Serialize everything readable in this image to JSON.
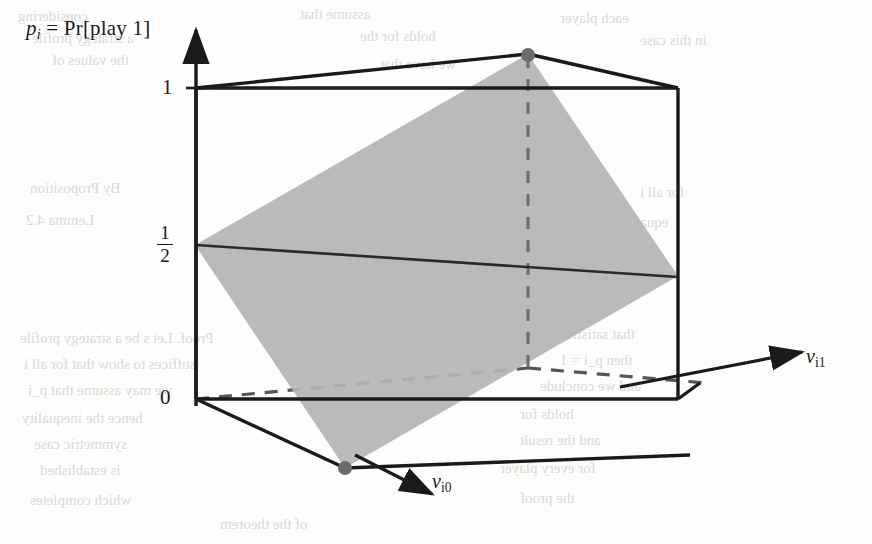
{
  "figure": {
    "domain": "chart",
    "caption_y_axis": "p_i = Pr[play 1]",
    "axis_caption_parts": {
      "p": "p",
      "i": "i",
      "eq": " = ",
      "pr": "Pr[play 1]"
    },
    "y_ticks": [
      {
        "label": "1",
        "value": 1
      },
      {
        "label": "1/2",
        "numerator": "1",
        "denominator": "2",
        "value": 0.5
      },
      {
        "label": "0",
        "value": 0
      }
    ],
    "x_axis_label": "v",
    "x_axis_sub": "i1",
    "z_axis_label": "v",
    "z_axis_sub": "i0",
    "colors": {
      "line": "#1a1a1a",
      "plane_fill": "#b3b3b3",
      "dashed": "#6e6e6e",
      "marker": "#6b6b6b",
      "background": "#fdfdfc",
      "bleed_text": "#cfcdc8"
    }
  },
  "chart_data": {
    "type": "diagram-3d",
    "title": "",
    "axes": {
      "vertical": {
        "name": "p_i = Pr[play 1]",
        "ticks": [
          "0",
          "1/2",
          "1"
        ],
        "range": [
          0,
          1
        ]
      },
      "horizontal_right": {
        "name": "v_i1",
        "range": [
          0,
          1
        ]
      },
      "depth_front": {
        "name": "v_i0",
        "range": [
          0,
          1
        ]
      }
    },
    "cube_vertices_px": {
      "front_bottom_left": [
        195,
        398
      ],
      "front_top_left": [
        195,
        88
      ],
      "front_bottom_right": [
        678,
        398
      ],
      "front_top_right": [
        678,
        88
      ],
      "back_bottom_left": [
        345,
        468
      ],
      "back_top_left": [
        345,
        158
      ],
      "back_bottom_right": [
        828,
        468
      ],
      "back_top_right": [
        828,
        158
      ]
    },
    "plane_vertices_px": [
      [
        528,
        54
      ],
      [
        678,
        276
      ],
      [
        345,
        468
      ],
      [
        195,
        245
      ]
    ],
    "markers_px": [
      {
        "name": "top-back-vertex",
        "x": 528,
        "y": 54
      },
      {
        "name": "bottom-front-vertex",
        "x": 345,
        "y": 468
      }
    ],
    "dashed_segments": [
      {
        "name": "vertical-back-edge",
        "from": [
          528,
          54
        ],
        "to": [
          528,
          368
        ]
      },
      {
        "name": "bottom-back-edge-left",
        "from": [
          195,
          398
        ],
        "to": [
          528,
          368
        ]
      },
      {
        "name": "bottom-back-edge-right",
        "from": [
          528,
          368
        ],
        "to": [
          700,
          382
        ]
      }
    ],
    "half_level_line": {
      "from": [
        195,
        245
      ],
      "to": [
        678,
        276
      ]
    },
    "legend": [],
    "grid": false
  },
  "bleed_lines": [
    {
      "text": "considering",
      "x": 18,
      "y": 8
    },
    {
      "text": "assume that",
      "x": 300,
      "y": 6
    },
    {
      "text": "each player",
      "x": 560,
      "y": 10
    },
    {
      "text": "a strategy profile",
      "x": 32,
      "y": 30
    },
    {
      "text": "holds for the",
      "x": 360,
      "y": 28
    },
    {
      "text": "in this case",
      "x": 640,
      "y": 32
    },
    {
      "text": "the values of",
      "x": 52,
      "y": 52
    },
    {
      "text": "we have that",
      "x": 380,
      "y": 56
    },
    {
      "text": "By Proposition",
      "x": 30,
      "y": 180
    },
    {
      "text": "we obtain that",
      "x": 330,
      "y": 176
    },
    {
      "text": "for all i",
      "x": 640,
      "y": 184
    },
    {
      "text": "Lemma 4.2",
      "x": 26,
      "y": 212
    },
    {
      "text": "it follows that",
      "x": 300,
      "y": 206
    },
    {
      "text": "equality",
      "x": 620,
      "y": 214
    },
    {
      "text": "Proof. Let s be a strategy profile",
      "x": 20,
      "y": 330
    },
    {
      "text": "that satisfies",
      "x": 560,
      "y": 326
    },
    {
      "text": "suffices to show that for all i",
      "x": 24,
      "y": 356
    },
    {
      "text": "then p_i = 1",
      "x": 560,
      "y": 352
    },
    {
      "text": "we may assume that p_i",
      "x": 28,
      "y": 382
    },
    {
      "text": "and we conclude",
      "x": 540,
      "y": 378
    },
    {
      "text": "hence the inequality",
      "x": 22,
      "y": 410
    },
    {
      "text": "holds for",
      "x": 520,
      "y": 406
    },
    {
      "text": "symmetric case",
      "x": 34,
      "y": 436
    },
    {
      "text": "and the result",
      "x": 520,
      "y": 432
    },
    {
      "text": "is established",
      "x": 40,
      "y": 462
    },
    {
      "text": "for every player",
      "x": 500,
      "y": 460
    },
    {
      "text": "which completes",
      "x": 30,
      "y": 492
    },
    {
      "text": "the proof",
      "x": 520,
      "y": 490
    },
    {
      "text": "of the theorem",
      "x": 220,
      "y": 516
    }
  ]
}
